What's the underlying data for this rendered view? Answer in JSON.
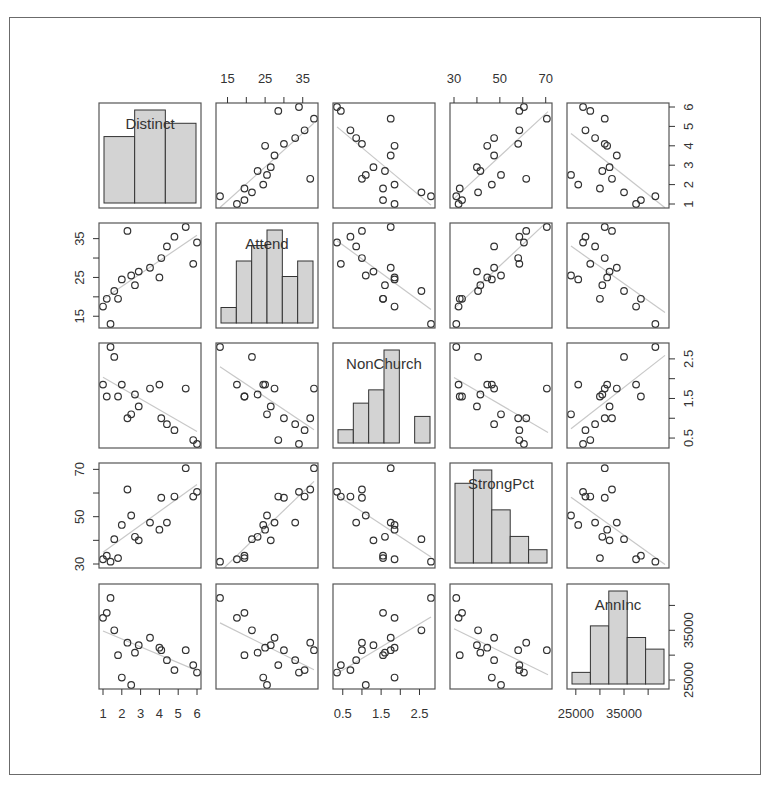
{
  "chart_data": {
    "type": "scatter",
    "subtype": "scatterplot-matrix",
    "title": "",
    "variables": [
      "Distinct",
      "Attend",
      "NonChurch",
      "StrongPct",
      "AnnInc"
    ],
    "ranges": {
      "Distinct": [
        1,
        6
      ],
      "Attend": [
        13,
        38
      ],
      "NonChurch": [
        0.35,
        2.8
      ],
      "StrongPct": [
        30,
        71
      ],
      "AnnInc": [
        24000,
        43500
      ]
    },
    "ticks": {
      "Distinct": [
        1,
        2,
        3,
        4,
        5,
        6
      ],
      "Attend": [
        15,
        25,
        35
      ],
      "Attend_minor": [
        15,
        20,
        25,
        30,
        35
      ],
      "NonChurch": [
        0.5,
        1.5,
        2.5
      ],
      "NonChurch_minor": [
        0.5,
        1.0,
        1.5,
        2.0,
        2.5
      ],
      "StrongPct": [
        30,
        50,
        70
      ],
      "StrongPct_minor": [
        30,
        40,
        50,
        60,
        70
      ],
      "AnnInc": [
        25000,
        35000
      ],
      "AnnInc_minor": [
        25000,
        30000,
        35000,
        40000
      ]
    },
    "tick_labels": {
      "top": {
        "col": 1,
        "var": "Attend",
        "labels": [
          "15",
          "25",
          "35"
        ]
      },
      "top2": {
        "col": 3,
        "var": "StrongPct",
        "labels": [
          "30",
          "50",
          "70"
        ]
      },
      "right": {
        "row": 0,
        "var": "Distinct",
        "labels": [
          "1",
          "2",
          "3",
          "4",
          "5",
          "6"
        ]
      },
      "right2": {
        "row": 2,
        "var": "NonChurch",
        "labels": [
          "0.5",
          "1.5",
          "2.5"
        ]
      },
      "right3": {
        "row": 4,
        "var": "AnnInc",
        "labels": [
          "25000",
          "35000"
        ]
      },
      "left": {
        "row": 1,
        "var": "Attend",
        "labels": [
          "15",
          "25",
          "35"
        ]
      },
      "left2": {
        "row": 3,
        "var": "StrongPct",
        "labels": [
          "30",
          "50",
          "70"
        ]
      },
      "bottom": {
        "col": 0,
        "var": "Distinct",
        "labels": [
          "1",
          "2",
          "3",
          "4",
          "5",
          "6"
        ]
      },
      "bottom2": {
        "col": 2,
        "var": "NonChurch",
        "labels": [
          "0.5",
          "1.5",
          "2.5"
        ]
      },
      "bottom3": {
        "col": 4,
        "var": "AnnInc",
        "labels": [
          "25000",
          "35000"
        ]
      }
    },
    "observations": {
      "Distinct": [
        1.0,
        1.2,
        1.4,
        1.6,
        1.8,
        2.0,
        2.3,
        2.5,
        2.7,
        2.9,
        3.5,
        4.0,
        4.1,
        4.4,
        4.8,
        5.4,
        5.8,
        6.0
      ],
      "Attend": [
        17.5,
        19.5,
        13.0,
        21.5,
        19.5,
        24.5,
        37.0,
        25.5,
        23.0,
        26.5,
        27.5,
        25.0,
        30.0,
        33.0,
        35.5,
        38.0,
        28.5,
        34.0
      ],
      "NonChurch": [
        1.85,
        1.55,
        2.8,
        2.55,
        1.55,
        1.85,
        1.0,
        1.1,
        1.6,
        1.3,
        1.75,
        1.85,
        1.0,
        0.85,
        0.7,
        1.75,
        0.45,
        0.35
      ],
      "StrongPct": [
        32.0,
        33.5,
        31.0,
        40.5,
        32.5,
        46.5,
        61.5,
        50.5,
        41.5,
        40.0,
        47.5,
        44.5,
        58.0,
        47.5,
        58.5,
        70.5,
        58.5,
        60.5
      ],
      "AnnInc": [
        37500,
        38500,
        41500,
        35000,
        30000,
        25500,
        32500,
        24000,
        30500,
        32000,
        33500,
        31500,
        31000,
        29000,
        27000,
        31000,
        28000,
        26500
      ]
    },
    "histograms": {
      "Distinct": {
        "bins": [
          1,
          2.67,
          4.33,
          6
        ],
        "counts": [
          5,
          7,
          6
        ]
      },
      "Attend": {
        "bins": [
          12.5,
          17.5,
          22.5,
          27.5,
          32.5,
          37.5,
          42.5
        ],
        "counts": [
          1,
          4,
          5,
          6,
          3,
          4
        ]
      },
      "NonChurch": {
        "bins": [
          0.25,
          0.75,
          1.25,
          1.75,
          2.25,
          2.75,
          3.0
        ],
        "counts": [
          1,
          3,
          4,
          7,
          0,
          2
        ]
      },
      "StrongPct": {
        "bins": [
          30,
          40,
          50,
          60,
          70,
          80
        ],
        "counts": [
          6,
          7,
          4,
          2,
          1
        ]
      },
      "AnnInc": {
        "bins": [
          22500,
          27500,
          32500,
          37500,
          42500,
          47500
        ],
        "counts": [
          1,
          5,
          8,
          4,
          3
        ]
      }
    },
    "panel_style": {
      "point_shape": "open-circle",
      "point_color": "#333333",
      "fit_line_color": "#c8c8c8",
      "hist_fill": "#d3d3d3",
      "hist_border": "#333333",
      "frame_color": "#555555"
    },
    "diagonal": "histogram-with-variable-name",
    "off_diagonal": "scatter-with-linear-fit",
    "grid": false,
    "legend": null
  }
}
